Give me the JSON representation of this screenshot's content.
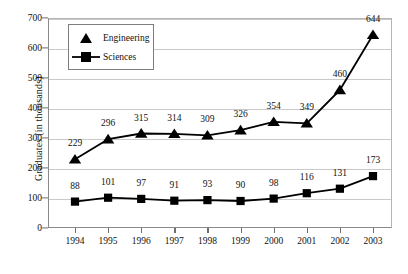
{
  "chart_data": {
    "type": "line",
    "title": "",
    "xlabel": "",
    "ylabel": "Graduates (in thousands)",
    "categories": [
      "1994",
      "1995",
      "1996",
      "1997",
      "1998",
      "1999",
      "2000",
      "2001",
      "2002",
      "2003"
    ],
    "series": [
      {
        "name": "Engineering",
        "marker": "triangle",
        "color": "#000000",
        "values": [
          229,
          296,
          315,
          314,
          309,
          326,
          354,
          349,
          460,
          644
        ]
      },
      {
        "name": "Sciences",
        "marker": "square",
        "color": "#000000",
        "values": [
          88,
          101,
          97,
          91,
          93,
          90,
          98,
          116,
          131,
          173
        ]
      }
    ],
    "ylim": [
      0,
      700
    ],
    "yticks": [
      0,
      100,
      200,
      300,
      400,
      500,
      600,
      700
    ],
    "ytick_labels": [
      "0",
      "100",
      "200",
      "300",
      "400",
      "500",
      "600",
      "700"
    ],
    "grid": true,
    "grid_axis": "y",
    "legend_position": "top-left",
    "data_labels": true
  },
  "legend": {
    "entries": [
      {
        "label": "Engineering",
        "icon": "triangle-marker-icon"
      },
      {
        "label": "Sciences",
        "icon": "square-marker-icon"
      }
    ]
  }
}
